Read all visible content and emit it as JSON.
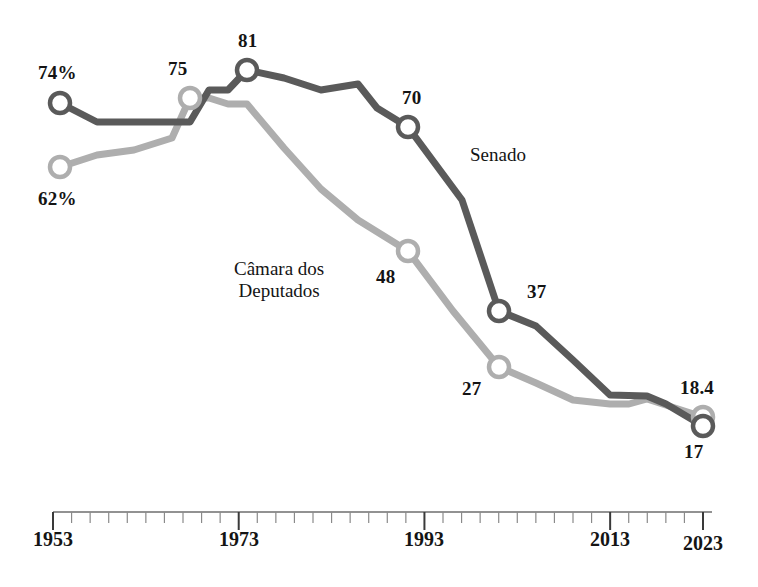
{
  "chart_data": {
    "type": "line",
    "title": "",
    "subtitle": "",
    "xlabel": "",
    "ylabel": "",
    "xlim": [
      1953,
      2023
    ],
    "ylim": [
      0,
      100
    ],
    "grid": false,
    "legend_position": "inline-annotation",
    "x_tick_labels": [
      "1953",
      "1973",
      "1993",
      "2013",
      "2023"
    ],
    "x_major_ticks": [
      1953,
      1973,
      1993,
      2013,
      2023
    ],
    "x_minor_tick_step": 2,
    "series": [
      {
        "name": "Senado",
        "color": "#5a5a5a",
        "label_color": "#141414",
        "x": [
          1953,
          1957,
          1961,
          1965,
          1969,
          1971,
          1973,
          1975,
          1979,
          1983,
          1987,
          1989,
          1991,
          1995,
          1999,
          2003,
          2007,
          2011,
          2015,
          2019,
          2023
        ],
        "values": [
          74,
          72,
          72,
          72,
          72,
          78,
          78,
          81,
          79,
          79,
          77,
          73,
          70,
          52,
          37,
          36,
          30,
          22,
          22,
          19,
          17
        ],
        "annotated_points": [
          {
            "x": 1953,
            "value": 74,
            "label": "74%"
          },
          {
            "x": 1975,
            "value": 81,
            "label": "81"
          },
          {
            "x": 1991,
            "value": 70,
            "label": "70"
          },
          {
            "x": 1999,
            "value": 37,
            "label": "37"
          },
          {
            "x": 2023,
            "value": 17,
            "label": "17"
          }
        ]
      },
      {
        "name": "Câmara dos Deputados",
        "color": "#aeaeae",
        "label_color": "#141414",
        "x": [
          1953,
          1957,
          1961,
          1965,
          1969,
          1971,
          1973,
          1975,
          1979,
          1983,
          1987,
          1991,
          1995,
          1999,
          2003,
          2007,
          2011,
          2015,
          2019,
          2023
        ],
        "values": [
          62,
          66,
          67,
          71,
          75,
          75,
          73,
          73,
          66,
          59,
          54,
          48,
          40,
          27,
          25,
          21,
          20,
          20,
          21,
          18.4
        ],
        "annotated_points": [
          {
            "x": 1953,
            "value": 62,
            "label": "62%"
          },
          {
            "x": 1971,
            "value": 75,
            "label": "75"
          },
          {
            "x": 1991,
            "value": 48,
            "label": "48"
          },
          {
            "x": 1999,
            "value": 27,
            "label": "27"
          },
          {
            "x": 2023,
            "value": 18.4,
            "label": "18.4"
          }
        ]
      }
    ],
    "annotations": [
      {
        "text": "Senado",
        "x": 1999,
        "y": 66
      },
      {
        "text": "Câmara dos",
        "x": 1981,
        "y": 32
      },
      {
        "text": "Deputados",
        "x": 1981,
        "y": 27
      }
    ]
  },
  "labels": {
    "senado_line1": "Senado",
    "camara_line1": "Câmara dos",
    "camara_line2": "Deputados",
    "senado_start": "74%",
    "senado_peak": "81",
    "senado_1991": "70",
    "senado_1999": "37",
    "senado_end": "17",
    "camara_start": "62%",
    "camara_1971": "75",
    "camara_1991": "48",
    "camara_1999": "27",
    "camara_end": "18.4"
  },
  "axis": {
    "t1953": "1953",
    "t1973": "1973",
    "t1993": "1993",
    "t2013": "2013",
    "t2023": "2023"
  }
}
